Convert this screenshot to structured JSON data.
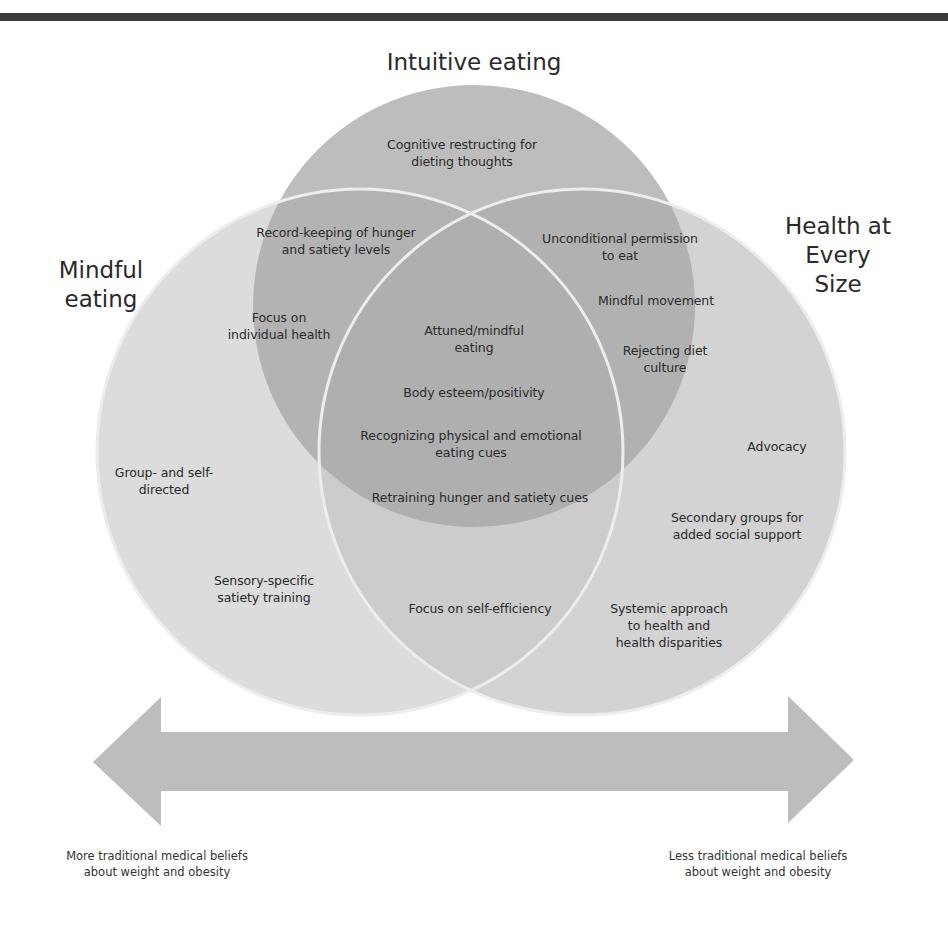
{
  "colors": {
    "topbar": "#3a3a3a",
    "circle_top": "#a8a8a8",
    "circle_left": "#d4d4d4",
    "circle_right": "#c8c8c8",
    "outline": "#ececec",
    "arrow": "#bdbdbd"
  },
  "titles": {
    "intuitive": "Intuitive eating",
    "mindful": "Mindful\neating",
    "haes": "Health at\nEvery Size"
  },
  "labels": {
    "cognitive": "Cognitive restructing for\ndieting thoughts",
    "record_keeping": "Record-keeping of hunger\nand satiety levels",
    "focus_individual": "Focus on\nindividual health",
    "unconditional": "Unconditional permission\nto eat",
    "mindful_movement": "Mindful movement",
    "rejecting": "Rejecting diet\nculture",
    "attuned": "Attuned/mindful\neating",
    "body_esteem": "Body esteem/positivity",
    "recognizing": "Recognizing physical and emotional\neating cues",
    "retraining": "Retraining hunger and satiety cues",
    "group": "Group- and self-\ndirected",
    "sensory": "Sensory-specific\nsatiety training",
    "self_efficiency": "Focus on self-efficiency",
    "advocacy": "Advocacy",
    "secondary": "Secondary groups for\nadded social support",
    "systemic": "Systemic approach\nto health and\nhealth disparities"
  },
  "arrow": {
    "left_label": "More traditional medical beliefs\nabout weight and obesity",
    "right_label": "Less traditional medical beliefs\nabout weight and obesity"
  }
}
